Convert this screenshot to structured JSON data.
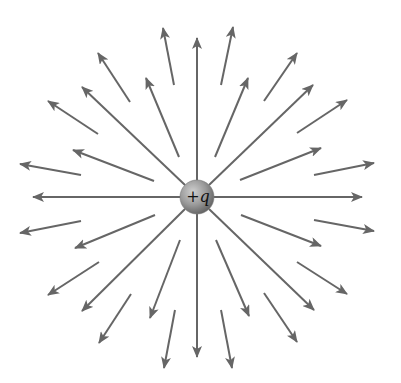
{
  "diagram": {
    "charge": {
      "sign": "+",
      "symbol": "q",
      "label": "+q",
      "center": [
        197,
        197
      ],
      "radius": 17
    },
    "colors": {
      "line": "#666666",
      "sphere_light": "#c8c8c8",
      "sphere_dark": "#6e6e6e",
      "label": "#111111",
      "background": "#ffffff"
    },
    "long_lines": [
      {
        "from": [
          197,
          180
        ],
        "to": [
          197,
          38
        ]
      },
      {
        "from": [
          197,
          214
        ],
        "to": [
          197,
          357
        ]
      },
      {
        "from": [
          180,
          197
        ],
        "to": [
          33,
          197
        ]
      },
      {
        "from": [
          214,
          197
        ],
        "to": [
          362,
          197
        ]
      },
      {
        "from": [
          185,
          185
        ],
        "to": [
          82,
          87
        ]
      },
      {
        "from": [
          209,
          185
        ],
        "to": [
          313,
          85
        ]
      },
      {
        "from": [
          185,
          209
        ],
        "to": [
          82,
          311
        ]
      },
      {
        "from": [
          209,
          209
        ],
        "to": [
          314,
          310
        ]
      }
    ],
    "medium_arrows": [
      {
        "from": [
          179,
          157
        ],
        "to": [
          146,
          78
        ]
      },
      {
        "from": [
          215,
          157
        ],
        "to": [
          248,
          78
        ]
      },
      {
        "from": [
          154,
          181
        ],
        "to": [
          73,
          150
        ]
      },
      {
        "from": [
          240,
          180
        ],
        "to": [
          321,
          148
        ]
      },
      {
        "from": [
          155,
          215
        ],
        "to": [
          75,
          248
        ]
      },
      {
        "from": [
          241,
          215
        ],
        "to": [
          321,
          246
        ]
      },
      {
        "from": [
          180,
          240
        ],
        "to": [
          150,
          318
        ]
      },
      {
        "from": [
          216,
          240
        ],
        "to": [
          249,
          316
        ]
      }
    ],
    "short_arrows": [
      {
        "from": [
          174,
          85
        ],
        "to": [
          163,
          28
        ]
      },
      {
        "from": [
          221,
          85
        ],
        "to": [
          233,
          27
        ]
      },
      {
        "from": [
          130,
          102
        ],
        "to": [
          98,
          53
        ]
      },
      {
        "from": [
          264,
          101
        ],
        "to": [
          297,
          53
        ]
      },
      {
        "from": [
          98,
          134
        ],
        "to": [
          48,
          101
        ]
      },
      {
        "from": [
          297,
          133
        ],
        "to": [
          347,
          100
        ]
      },
      {
        "from": [
          81,
          175
        ],
        "to": [
          20,
          164
        ]
      },
      {
        "from": [
          314,
          175
        ],
        "to": [
          374,
          163
        ]
      },
      {
        "from": [
          81,
          221
        ],
        "to": [
          20,
          233
        ]
      },
      {
        "from": [
          314,
          220
        ],
        "to": [
          374,
          231
        ]
      },
      {
        "from": [
          99,
          262
        ],
        "to": [
          48,
          295
        ]
      },
      {
        "from": [
          297,
          262
        ],
        "to": [
          347,
          294
        ]
      },
      {
        "from": [
          131,
          294
        ],
        "to": [
          99,
          343
        ]
      },
      {
        "from": [
          264,
          293
        ],
        "to": [
          297,
          342
        ]
      },
      {
        "from": [
          175,
          310
        ],
        "to": [
          164,
          368
        ]
      },
      {
        "from": [
          221,
          310
        ],
        "to": [
          232,
          368
        ]
      }
    ]
  }
}
